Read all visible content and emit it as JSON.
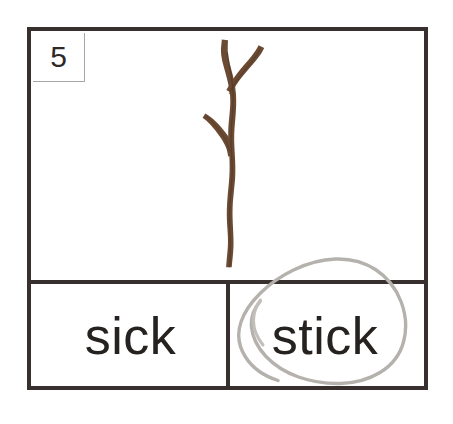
{
  "worksheet": {
    "item_number": "5",
    "prompt_type": "picture-word-match",
    "picture": {
      "subject": "stick",
      "icon_name": "stick-illustration",
      "color": "#6b4a33",
      "shadow_color": "#4d3524"
    },
    "answers": [
      {
        "id": "sick",
        "label": "sick",
        "selected": false
      },
      {
        "id": "stick",
        "label": "stick",
        "selected": true
      }
    ],
    "annotation": {
      "type": "pencil-circle",
      "target": "stick",
      "color": "#b5b2ae"
    },
    "colors": {
      "frame": "#38302e",
      "text": "#262220",
      "number_border": "#a9a5a2",
      "page": "#ffffff"
    }
  }
}
